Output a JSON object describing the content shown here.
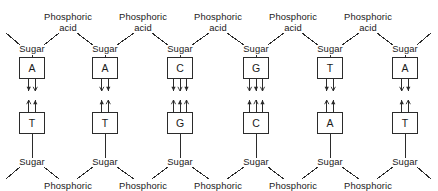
{
  "diagram": {
    "backbone_label_sugar": "Sugar",
    "backbone_label_phosphate_line1": "Phosphoric",
    "backbone_label_phosphate_line2": "acid",
    "stroke_color": "#2b2b2b",
    "text_color": "#1a1a1a",
    "background_color": "#ffffff",
    "columns": [
      {
        "index": 0,
        "center_x": 32,
        "top_base": "A",
        "bottom_base": "T",
        "hydrogen_bonds": 2
      },
      {
        "index": 1,
        "center_x": 105,
        "top_base": "A",
        "bottom_base": "T",
        "hydrogen_bonds": 2
      },
      {
        "index": 2,
        "center_x": 180,
        "top_base": "C",
        "bottom_base": "G",
        "hydrogen_bonds": 3
      },
      {
        "index": 3,
        "center_x": 256,
        "top_base": "G",
        "bottom_base": "C",
        "hydrogen_bonds": 3
      },
      {
        "index": 4,
        "center_x": 330,
        "top_base": "T",
        "bottom_base": "A",
        "hydrogen_bonds": 2
      },
      {
        "index": 5,
        "center_x": 405,
        "top_base": "A",
        "bottom_base": "T",
        "hydrogen_bonds": 2
      }
    ],
    "top_strand_sequence": [
      "A",
      "A",
      "C",
      "G",
      "T",
      "A"
    ],
    "bottom_strand_sequence": [
      "T",
      "T",
      "G",
      "C",
      "A",
      "T"
    ],
    "phosphate_positions_top_x": [
      68,
      143,
      218,
      293,
      368
    ],
    "phosphate_positions_bottom_x": [
      68,
      143,
      218,
      293,
      368
    ],
    "geometry": {
      "sugar_top_y": 44,
      "sugar_bottom_y": 157,
      "base_top_y": 57,
      "base_bottom_y": 112,
      "box_w": 26,
      "box_h": 22
    }
  }
}
